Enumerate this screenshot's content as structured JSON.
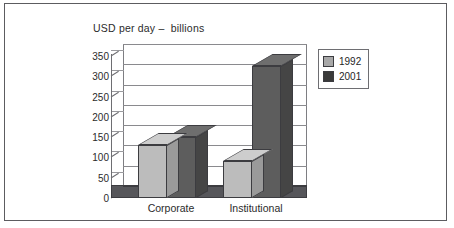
{
  "chart_data": {
    "type": "bar",
    "title": "USD per day –  billions",
    "xlabel": "",
    "ylabel": "",
    "categories": [
      "Corporate",
      "Institutional"
    ],
    "series": [
      {
        "name": "1992",
        "values": [
          130,
          90
        ],
        "color": "#bcbcbc"
      },
      {
        "name": "2001",
        "values": [
          150,
          325
        ],
        "color": "#5d5d5d"
      }
    ],
    "ylim": [
      0,
      350
    ],
    "yticks": [
      0,
      50,
      100,
      150,
      200,
      250,
      300,
      350
    ],
    "ytick_labels": [
      "0",
      "50",
      "100",
      "150",
      "200",
      "250",
      "300",
      "350"
    ],
    "grid": true,
    "legend_position": "right",
    "three_d": true
  },
  "legend": {
    "items": [
      {
        "label": "1992",
        "color": "#a8a8a8"
      },
      {
        "label": "2001",
        "color": "#3a3a3a"
      }
    ]
  },
  "style": {
    "frame_color": "#5c5c60",
    "grid_color": "#8a8a8e",
    "axis_color": "#6e6e72",
    "text_color": "#2b2b2b",
    "background": "#ffffff"
  }
}
